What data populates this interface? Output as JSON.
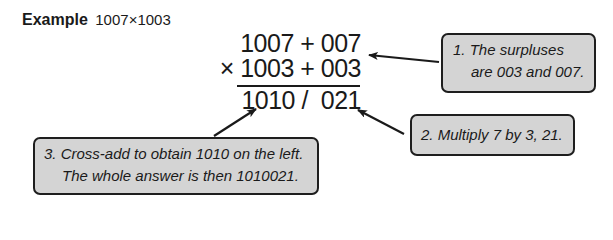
{
  "title": {
    "label": "Example",
    "expression": "1007×1003"
  },
  "calculation": {
    "row1": "1007 + 007",
    "row2": "× 1003 + 003",
    "result": "1010 /  021"
  },
  "callouts": [
    {
      "number": "1.",
      "lines": [
        "1. The surpluses",
        "are 003 and 007."
      ]
    },
    {
      "number": "2.",
      "lines": [
        "2. Multiply 7 by 3, 21."
      ]
    },
    {
      "number": "3.",
      "lines": [
        "3. Cross-add to obtain 1010 on the left.",
        "The whole answer is then 1010021."
      ]
    }
  ],
  "colors": {
    "callout_fill": "#d4d4d4",
    "callout_border": "#1e1e1e",
    "text": "#1a1a1a"
  }
}
